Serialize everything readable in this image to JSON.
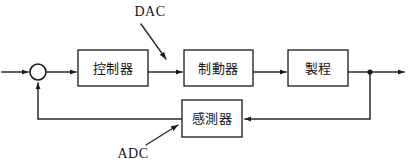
{
  "diagram": {
    "background_color": "#ffffff",
    "line_color": "#2a2a2a",
    "text_color": "#141414",
    "blocks": [
      {
        "id": "controller",
        "label": "控制器",
        "x": 78,
        "y": 50,
        "w": 70,
        "h": 36
      },
      {
        "id": "actuator",
        "label": "制動器",
        "x": 184,
        "y": 50,
        "w": 69,
        "h": 36
      },
      {
        "id": "process",
        "label": "製程",
        "x": 288,
        "y": 50,
        "w": 60,
        "h": 36
      },
      {
        "id": "sensor",
        "label": "感測器",
        "x": 182,
        "y": 100,
        "w": 60,
        "h": 37
      }
    ],
    "summing_junction": {
      "id": "sum",
      "cx": 38,
      "cy": 72,
      "r": 8
    },
    "branch_node": {
      "id": "output-branch",
      "cx": 370,
      "cy": 72,
      "r": 2.6
    },
    "annotations": [
      {
        "id": "dac",
        "label": "DAC",
        "text_x": 150,
        "text_y": 13
      },
      {
        "id": "adc",
        "label": "ADC",
        "text_x": 133,
        "text_y": 155
      }
    ]
  }
}
